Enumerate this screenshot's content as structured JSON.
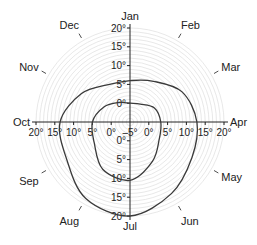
{
  "chart_data": {
    "type": "polar-line",
    "title": "",
    "center_value": -5,
    "max_value": 20,
    "radial_unit": "°",
    "grid_step": 1,
    "months": [
      "Jan",
      "Feb",
      "Mar",
      "Apr",
      "May",
      "Jun",
      "Jul",
      "Aug",
      "Sep",
      "Oct",
      "Nov",
      "Dec"
    ],
    "axis_tick_values": [
      20,
      15,
      10,
      5,
      0,
      -5
    ],
    "axis_tick_labels": {
      "top": [
        "20°",
        "15°",
        "10°",
        "5°",
        "0°"
      ],
      "bottom": [
        "0°",
        "5°",
        "10°",
        "15°",
        "20°"
      ],
      "left": [
        "20°",
        "15°",
        "10°",
        "5°",
        "0°"
      ],
      "right": [
        "0°",
        "5°",
        "10°",
        "15°",
        "20°"
      ],
      "center": "–5°"
    },
    "series": [
      {
        "name": "outer",
        "values": [
          6,
          7.5,
          11,
          12.8,
          14,
          17,
          20,
          18.5,
          14.5,
          13.6,
          10,
          6.5
        ]
      },
      {
        "name": "inner",
        "values": [
          0,
          0.5,
          2.5,
          3.2,
          4,
          7,
          10.5,
          9.5,
          6,
          5,
          3,
          1
        ]
      }
    ],
    "colors": {
      "grid": "#d8d8d8",
      "axis": "#222222",
      "line": "#3a3a3a"
    }
  }
}
